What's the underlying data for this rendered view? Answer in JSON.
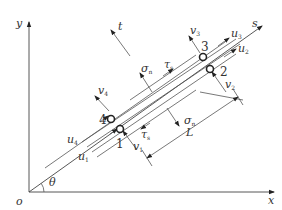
{
  "figure": {
    "axes": {
      "x_label": "x",
      "y_label": "y",
      "origin_label": "o",
      "s_label": "s",
      "t_label": "t",
      "angle_label": "θ"
    },
    "nodes": [
      {
        "id": "1",
        "label": "1"
      },
      {
        "id": "2",
        "label": "2"
      },
      {
        "id": "3",
        "label": "3"
      },
      {
        "id": "4",
        "label": "4"
      }
    ],
    "displacements": {
      "u1": {
        "base": "u",
        "sub": "1"
      },
      "u2": {
        "base": "u",
        "sub": "2"
      },
      "u3": {
        "base": "u",
        "sub": "3"
      },
      "u4": {
        "base": "u",
        "sub": "4"
      },
      "v1": {
        "base": "v",
        "sub": "1"
      },
      "v2": {
        "base": "v",
        "sub": "2"
      },
      "v3": {
        "base": "v",
        "sub": "3"
      },
      "v4": {
        "base": "v",
        "sub": "4"
      }
    },
    "stresses": {
      "sigma_top": {
        "base": "σ",
        "sub": "n"
      },
      "tau_top": {
        "base": "τ",
        "sub": "s"
      },
      "sigma_bottom": {
        "base": "σ",
        "sub": "n"
      },
      "tau_bottom": {
        "base": "τ",
        "sub": "s"
      }
    },
    "dimension": {
      "label": "L"
    }
  }
}
